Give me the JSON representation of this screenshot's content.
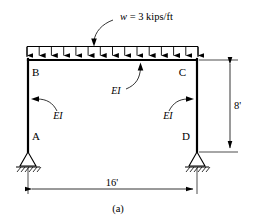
{
  "figure": {
    "caption": "(a)",
    "type": "structural-frame-diagram"
  },
  "load": {
    "label": "w = 3 kips/ft",
    "symbol": "w",
    "magnitude": "3",
    "units": "kips/ft",
    "direction": "downward",
    "arrow_count": 15
  },
  "nodes": [
    {
      "id": "B",
      "label": "B",
      "position": "top-left"
    },
    {
      "id": "C",
      "label": "C",
      "position": "top-right"
    },
    {
      "id": "A",
      "label": "A",
      "position": "bottom-left"
    },
    {
      "id": "D",
      "label": "D",
      "position": "bottom-right"
    }
  ],
  "members": [
    {
      "id": "BC",
      "label": "EI",
      "orientation": "horizontal",
      "name": "beam"
    },
    {
      "id": "AB",
      "label": "EI",
      "orientation": "vertical",
      "name": "left-column"
    },
    {
      "id": "CD",
      "label": "EI",
      "orientation": "vertical",
      "name": "right-column"
    }
  ],
  "supports": [
    {
      "at": "A",
      "kind": "pin"
    },
    {
      "at": "D",
      "kind": "pin"
    }
  ],
  "dimensions": [
    {
      "id": "height",
      "label": "8'",
      "value": "8",
      "units": "ft",
      "orientation": "vertical"
    },
    {
      "id": "span",
      "label": "16'",
      "value": "16",
      "units": "ft",
      "orientation": "horizontal"
    }
  ],
  "colors": {
    "line": "#000000",
    "background": "#ffffff"
  }
}
